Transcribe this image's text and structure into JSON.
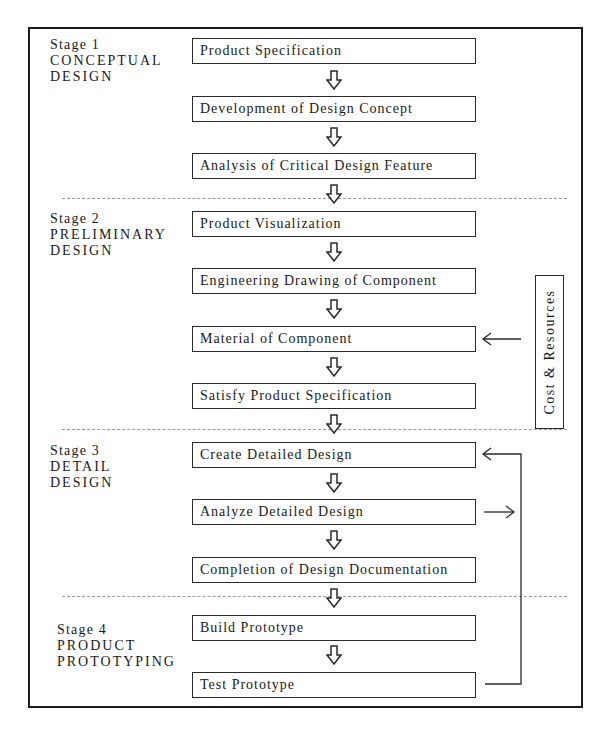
{
  "diagram": {
    "stages": [
      {
        "label": "Stage 1",
        "name_lines": [
          "CONCEPTUAL",
          "DESIGN"
        ],
        "steps": [
          "Product Specification",
          "Development of Design Concept",
          "Analysis of Critical Design Feature"
        ]
      },
      {
        "label": "Stage 2",
        "name_lines": [
          "PRELIMINARY",
          "DESIGN"
        ],
        "steps": [
          "Product Visualization",
          "Engineering Drawing of Component",
          "Material of Component",
          "Satisfy Product Specification"
        ]
      },
      {
        "label": "Stage 3",
        "name_lines": [
          "DETAIL",
          "DESIGN"
        ],
        "steps": [
          "Create Detailed Design",
          "Analyze Detailed Design",
          "Completion of Design Documentation"
        ]
      },
      {
        "label": "Stage 4",
        "name_lines": [
          "PRODUCT",
          "PROTOTYPING"
        ],
        "steps": [
          "Build Prototype",
          "Test Prototype"
        ]
      }
    ],
    "side_input": {
      "label": "Cost & Resources",
      "feeds_into": "Material of Component"
    },
    "feedback_loop": {
      "from": "Test Prototype",
      "to": "Create Detailed Design",
      "branch_from": "Analyze Detailed Design"
    },
    "colors": {
      "line": "#2a2a2a",
      "dash": "#9a9a9a",
      "background": "#ffffff"
    }
  }
}
